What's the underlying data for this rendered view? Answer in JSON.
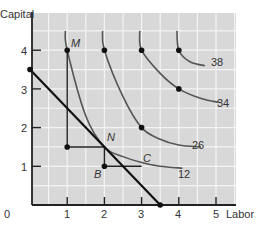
{
  "chart_data": {
    "type": "line",
    "title": "",
    "xlabel": "Labor",
    "ylabel": "Capital",
    "xlim": [
      0,
      5.5
    ],
    "ylim": [
      0,
      4.5
    ],
    "x_ticks": [
      "0",
      "1",
      "2",
      "3",
      "4",
      "5"
    ],
    "y_ticks": [
      "1",
      "2",
      "3",
      "4"
    ],
    "grid": true,
    "grid_step": 0.5,
    "series": [
      {
        "name": "12",
        "kind": "isoquant",
        "points": [
          [
            0.95,
            4.5
          ],
          [
            1,
            4
          ],
          [
            1.5,
            2.3
          ],
          [
            2,
            1.5
          ],
          [
            2.5,
            1.25
          ],
          [
            3,
            1.1
          ],
          [
            3.5,
            1.0
          ],
          [
            4.1,
            0.95
          ]
        ],
        "label": "12"
      },
      {
        "name": "26",
        "kind": "isoquant",
        "points": [
          [
            1.95,
            4.5
          ],
          [
            2,
            4
          ],
          [
            2.5,
            2.8
          ],
          [
            3,
            2.0
          ],
          [
            3.5,
            1.7
          ],
          [
            4,
            1.55
          ],
          [
            4.6,
            1.5
          ]
        ],
        "label": "26"
      },
      {
        "name": "34",
        "kind": "isoquant",
        "points": [
          [
            2.95,
            4.5
          ],
          [
            3,
            4
          ],
          [
            3.5,
            3.4
          ],
          [
            4,
            3.0
          ],
          [
            4.6,
            2.75
          ],
          [
            5.1,
            2.65
          ]
        ],
        "label": "34"
      },
      {
        "name": "38",
        "kind": "isoquant",
        "points": [
          [
            3.95,
            4.5
          ],
          [
            4,
            4
          ],
          [
            4.3,
            3.7
          ],
          [
            4.7,
            3.6
          ]
        ],
        "label": "38"
      },
      {
        "name": "isocost",
        "kind": "budget-line",
        "points": [
          [
            0,
            3.5
          ],
          [
            3.5,
            0
          ]
        ]
      },
      {
        "name": "path",
        "kind": "step-path",
        "points": [
          [
            1,
            4
          ],
          [
            1,
            1.5
          ],
          [
            2,
            1.5
          ],
          [
            2,
            1
          ],
          [
            3,
            1
          ]
        ]
      }
    ],
    "points": [
      {
        "label": "M",
        "x": 1,
        "y": 4
      },
      {
        "label": "N",
        "x": 2,
        "y": 1.5
      },
      {
        "label": "B",
        "x": 2,
        "y": 1
      },
      {
        "label": "C",
        "x": 3,
        "y": 1.1
      },
      {
        "label": "",
        "x": 1,
        "y": 1.5
      },
      {
        "label": "",
        "x": 2,
        "y": 4
      },
      {
        "label": "",
        "x": 3,
        "y": 4
      },
      {
        "label": "",
        "x": 4,
        "y": 4
      },
      {
        "label": "",
        "x": 3,
        "y": 2
      },
      {
        "label": "",
        "x": 4,
        "y": 3
      },
      {
        "label": "",
        "x": 0,
        "y": 3.5
      },
      {
        "label": "",
        "x": 3.5,
        "y": 0
      }
    ],
    "colors": {
      "background": "#d8d8d8",
      "grid": "#f2f2f2",
      "axis": "#222222",
      "curve": "#555555",
      "line": "#111111"
    }
  },
  "labels": {
    "ylabel": "Capital",
    "xlabel": "Labor",
    "origin": "0",
    "x1": "1",
    "x2": "2",
    "x3": "3",
    "x4": "4",
    "x5": "5",
    "y1": "1",
    "y2": "2",
    "y3": "3",
    "y4": "4",
    "M": "M",
    "N": "N",
    "B": "B",
    "C": "C",
    "q12": "12",
    "q26": "26",
    "q34": "34",
    "q38": "38"
  }
}
